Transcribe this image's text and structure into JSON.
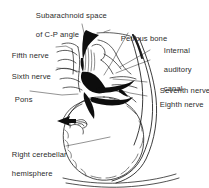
{
  "figure": {
    "title": "Subarachnoid space of C-P angle",
    "background_color": "#ffffff",
    "ink_color": "#1a1a1a",
    "text_color": "#2b2b2b",
    "width": 209,
    "height": 188
  },
  "labels": [
    {
      "id": "subarachnoid-space",
      "line1": "Subarachnoid space",
      "line2": "of C-P angle"
    },
    {
      "id": "petrous-bone",
      "line1": "Petrous bone"
    },
    {
      "id": "internal-auditory-canal",
      "line1": "Internal",
      "line2": "auditory",
      "line3": "canal"
    },
    {
      "id": "fifth-nerve",
      "line1": "Fifth nerve"
    },
    {
      "id": "sixth-nerve",
      "line1": "Sixth nerve"
    },
    {
      "id": "pons",
      "line1": "Pons"
    },
    {
      "id": "seventh-nerve",
      "line1": "Seventh nerve"
    },
    {
      "id": "eighth-nerve",
      "line1": "Eighth nerve"
    },
    {
      "id": "right-cerebellar-hemisphere",
      "line1": "Right cerebellar",
      "line2": "hemisphere"
    }
  ],
  "structures": [
    {
      "id": "subarachnoid-cistern-wedge",
      "fill": "solid-black"
    },
    {
      "id": "cisternal-black-mass",
      "fill": "solid-black"
    },
    {
      "id": "nerve-bundle-black",
      "fill": "solid-black"
    },
    {
      "id": "pointer-arrow",
      "fill": "solid-black"
    },
    {
      "id": "cerebellar-hemisphere-outline",
      "fill": "outline"
    },
    {
      "id": "petrous-bone-curve",
      "fill": "outline"
    },
    {
      "id": "brainstem-outline",
      "fill": "outline"
    }
  ]
}
